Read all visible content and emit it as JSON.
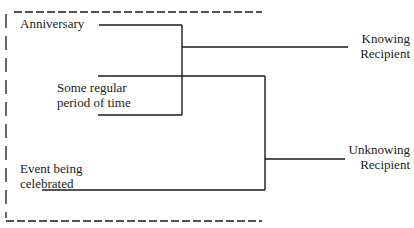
{
  "diagram": {
    "inputs": [
      {
        "label": "Anniversary"
      },
      {
        "label_line1": "Some regular",
        "label_line2": "period of time"
      },
      {
        "label_line1": "Event being",
        "label_line2": "celebrated"
      }
    ],
    "outputs": [
      {
        "label_line1": "Knowing",
        "label_line2": "Recipient"
      },
      {
        "label_line1": "Unknowing",
        "label_line2": "Recipient"
      }
    ],
    "colors": {
      "line": "#1a1a1a",
      "background": "#ffffff"
    }
  }
}
